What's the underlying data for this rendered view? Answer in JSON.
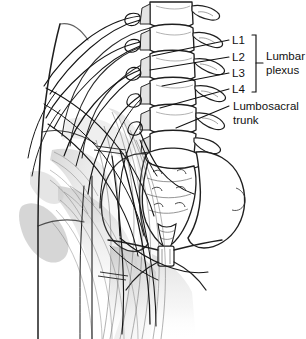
{
  "figure": {
    "style": "black-and-white medical line drawing with graphite shading",
    "background_color": "#ffffff",
    "line_color": "#1a1a1a",
    "shade_color": "#b9b9b9"
  },
  "labels": {
    "l1": "L1",
    "l2": "L2",
    "l3": "L3",
    "l4": "L4",
    "lumbar_plexus_line1": "Lumbar",
    "lumbar_plexus_line2": "plexus",
    "lumbosacral_line1": "Lumbosacral",
    "lumbosacral_line2": "trunk"
  },
  "anatomy": {
    "vertebrae": [
      "T12",
      "L1",
      "L2",
      "L3",
      "L4",
      "L5"
    ],
    "bones": [
      "lumbar vertebral column",
      "sacrum",
      "coccyx",
      "ilium",
      "pubic symphysis",
      "pubic rami",
      "ribs"
    ],
    "muscles": [
      "psoas major",
      "quadratus lumborum",
      "iliacus"
    ],
    "nerves": [
      "lumbar plexus roots",
      "lumbosacral trunk",
      "femoral nerve",
      "obturator nerve",
      "iliohypogastric nerve",
      "ilioinguinal nerve"
    ]
  }
}
